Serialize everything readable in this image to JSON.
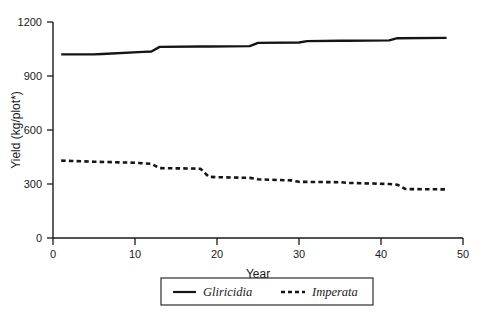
{
  "chart_data": {
    "type": "line",
    "title": "",
    "xlabel": "Year",
    "ylabel": "Yield (kg/plot*)",
    "xlim": [
      0,
      50
    ],
    "ylim": [
      0,
      1200
    ],
    "xticks": [
      0,
      10,
      20,
      30,
      40,
      50
    ],
    "yticks": [
      0,
      300,
      600,
      900,
      1200
    ],
    "xtick_labels": [
      "0",
      "10",
      "20",
      "30",
      "40",
      "50"
    ],
    "ytick_labels": [
      "0",
      "300",
      "600",
      "900",
      "1200"
    ],
    "grid": false,
    "legend_position": "bottom",
    "series": [
      {
        "name": "Gliricidia",
        "style": "solid",
        "color": "#151515",
        "x": [
          1,
          5,
          6,
          11,
          12,
          13,
          18,
          19,
          24,
          25,
          30,
          31,
          35,
          36,
          41,
          42,
          48
        ],
        "values": [
          1020,
          1020,
          1022,
          1034,
          1036,
          1062,
          1064,
          1064,
          1066,
          1084,
          1086,
          1094,
          1096,
          1096,
          1098,
          1110,
          1112
        ]
      },
      {
        "name": "Imperata",
        "style": "dashed",
        "color": "#151515",
        "x": [
          1,
          5,
          10,
          11,
          12,
          13,
          17,
          18,
          19,
          20,
          24,
          25,
          29,
          30,
          35,
          36,
          41,
          42,
          43,
          48
        ],
        "values": [
          430,
          424,
          418,
          415,
          412,
          388,
          386,
          384,
          340,
          338,
          334,
          326,
          320,
          312,
          310,
          306,
          300,
          296,
          272,
          270
        ]
      }
    ]
  },
  "axes": {
    "y_axis_title": "Yield (kg/plot*)",
    "x_axis_title": "Year"
  },
  "legend": {
    "items": [
      {
        "label": "Gliricidia",
        "style": "solid"
      },
      {
        "label": "Imperata",
        "style": "dashed"
      }
    ]
  }
}
